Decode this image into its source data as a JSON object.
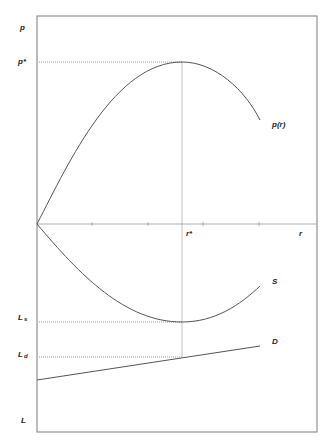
{
  "diagram": {
    "labels": {
      "p_axis": "p",
      "p_star": "p*",
      "p_curve": "p(r)",
      "r_axis": "r",
      "r_star": "r*",
      "S_curve": "S",
      "D_curve": "D",
      "L_s_main": "L",
      "L_s_sub": "s",
      "L_d_main": "L",
      "L_d_sub": "d",
      "L_axis": "L"
    },
    "curves": [
      {
        "name": "p(r)",
        "shape": "concave, rises from origin to maximum p* at r*, then declines"
      },
      {
        "name": "S",
        "shape": "convex, falls from origin to minimum L_s at r*, then rises"
      },
      {
        "name": "D",
        "shape": "straight line, upward sloping, equals L_d at r*"
      }
    ],
    "ticks_on_r_axis": 4
  }
}
